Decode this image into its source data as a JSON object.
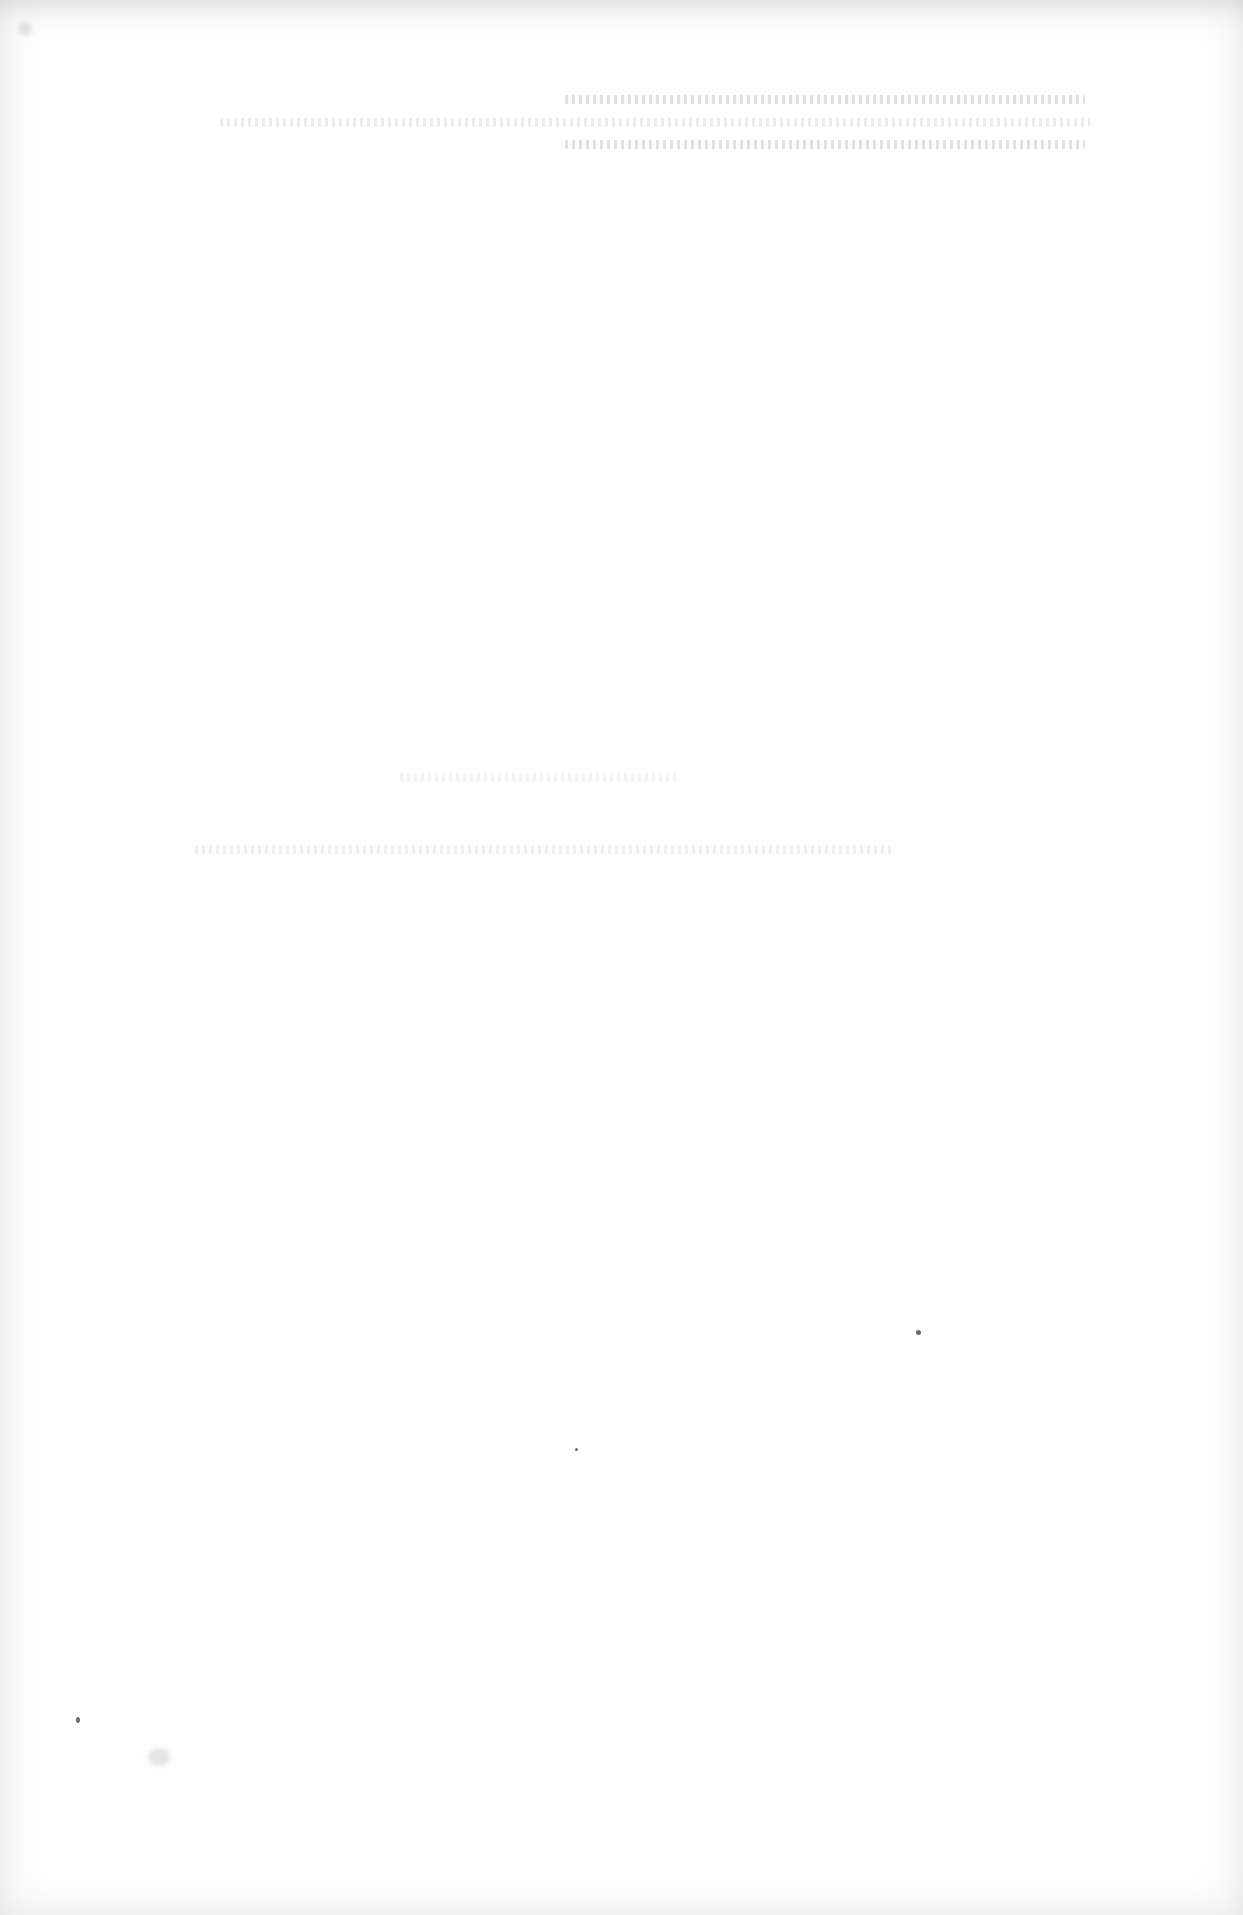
{
  "document": {
    "type": "blank-page",
    "legible_text": [],
    "paper_color": "#fefefe"
  }
}
